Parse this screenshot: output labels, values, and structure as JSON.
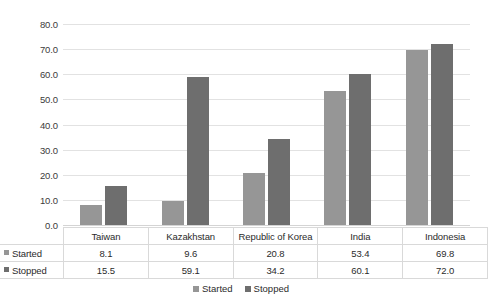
{
  "chart_data": {
    "type": "bar",
    "title": "",
    "xlabel": "",
    "ylabel": "",
    "ylim": [
      0,
      80
    ],
    "ytick_step": 10,
    "grid": true,
    "legend_position": "bottom",
    "categories": [
      "Taiwan",
      "Kazakhstan",
      "Republic of Korea",
      "India",
      "Indonesia"
    ],
    "series": [
      {
        "name": "Started",
        "color": "#969696",
        "values": [
          8.1,
          9.6,
          20.8,
          53.4,
          69.8
        ]
      },
      {
        "name": "Stopped",
        "color": "#6e6e6e",
        "values": [
          15.5,
          59.1,
          34.2,
          60.1,
          72.0
        ]
      }
    ],
    "ytick_labels": [
      "80.0",
      "70.0",
      "60.0",
      "50.0",
      "40.0",
      "30.0",
      "20.0",
      "10.0",
      "0.0"
    ],
    "value_labels": {
      "started": [
        "8.1",
        "9.6",
        "20.8",
        "53.4",
        "69.8"
      ],
      "stopped": [
        "15.5",
        "59.1",
        "34.2",
        "60.1",
        "72.0"
      ]
    }
  },
  "axis": {
    "ticks": [
      {
        "label": "80.0",
        "value": 80
      },
      {
        "label": "70.0",
        "value": 70
      },
      {
        "label": "60.0",
        "value": 60
      },
      {
        "label": "50.0",
        "value": 50
      },
      {
        "label": "40.0",
        "value": 40
      },
      {
        "label": "30.0",
        "value": 30
      },
      {
        "label": "20.0",
        "value": 20
      },
      {
        "label": "10.0",
        "value": 10
      },
      {
        "label": "0.0",
        "value": 0
      }
    ]
  },
  "table": {
    "corner_label": "",
    "column_headers": [
      "Taiwan",
      "Kazakhstan",
      "Republic of Korea",
      "India",
      "Indonesia"
    ],
    "rows": [
      {
        "series_label": "Started",
        "values": [
          "8.1",
          "9.6",
          "20.8",
          "53.4",
          "69.8"
        ]
      },
      {
        "series_label": "Stopped",
        "values": [
          "15.5",
          "59.1",
          "34.2",
          "60.1",
          "72.0"
        ]
      }
    ]
  },
  "legend": {
    "entries": [
      {
        "label": "Started",
        "color": "#969696"
      },
      {
        "label": "Stopped",
        "color": "#6e6e6e"
      }
    ]
  },
  "colors": {
    "started": "#969696",
    "stopped": "#6e6e6e",
    "gridline": "#e2e2e2",
    "table_border": "#d9d9d9",
    "text": "#2b2b2b",
    "background": "#ffffff"
  }
}
